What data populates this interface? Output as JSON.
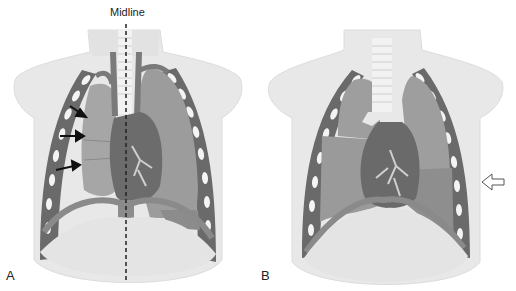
{
  "figure": {
    "panels": [
      {
        "id": "A",
        "label": "A",
        "annotation": "Midline",
        "arrows": 3,
        "description": "Chest with collapsed right lung, mediastinal shift away, midline dashed line"
      },
      {
        "id": "B",
        "label": "B",
        "arrows": 1,
        "description": "Chest with hollow arrow pointing to left lower chest wall"
      }
    ],
    "colors": {
      "body": "#e6e6e6",
      "body_shadow": "#d8d8d8",
      "lung": "#9a9a9a",
      "lung_collapsed": "#a8a8a8",
      "heart": "#6e6e6e",
      "vessels": "#7a7a7a",
      "ribs": "#6a6a6a",
      "rib_gaps": "#f4f4f4",
      "trachea": "#f0f0f0",
      "diaphragm": "#8a8a8a",
      "arrow": "#111111",
      "midline": "#222222"
    }
  }
}
